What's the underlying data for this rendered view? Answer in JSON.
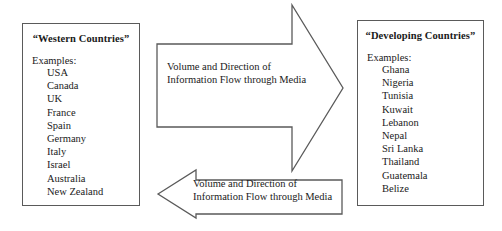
{
  "diagram": {
    "title_semantic": "media-flow-between-western-and-developing-countries",
    "boxes": {
      "western": {
        "title": "“Western Countries”",
        "examples_label": "Examples:",
        "countries": [
          "USA",
          "Canada",
          "UK",
          "France",
          "Spain",
          "Germany",
          "Italy",
          "Israel",
          "Australia",
          "New Zealand"
        ]
      },
      "developing": {
        "title": "“Developing Countries”",
        "examples_label": "Examples:",
        "countries": [
          "Ghana",
          "Nigeria",
          "Tunisia",
          "Kuwait",
          "Lebanon",
          "Nepal",
          "Sri Lanka",
          "Thailand",
          "Guatemala",
          "Belize"
        ]
      }
    },
    "arrows": {
      "rightward": {
        "label_line1": "Volume and Direction of",
        "label_line2": "Information Flow through Media",
        "direction": "right"
      },
      "leftward": {
        "label_line1": "Volume and Direction of",
        "label_line2": "Information Flow through Media",
        "direction": "left"
      }
    },
    "colors": {
      "stroke": "#5a5a5a",
      "text": "#1a1a1a",
      "background": "#ffffff"
    }
  }
}
